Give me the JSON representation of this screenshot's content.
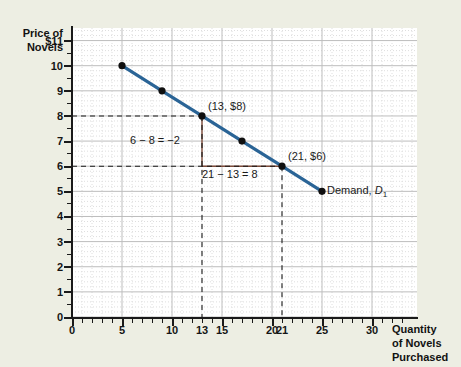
{
  "figure": {
    "background_color": "#edeee3",
    "plot_background_color": "#ffffff"
  },
  "axes": {
    "y_title_line1": "Price of",
    "y_title_line2": "Novels",
    "x_title_line1": "Quantity",
    "x_title_line2": "of Novels",
    "x_title_line3": "Purchased",
    "y_ticks": [
      "0",
      "1",
      "2",
      "3",
      "4",
      "5",
      "6",
      "7",
      "8",
      "9",
      "10",
      "$11"
    ],
    "x_ticks": [
      "0",
      "5",
      "10",
      "13",
      "15",
      "20",
      "21",
      "25",
      "30"
    ]
  },
  "annotations": {
    "point_a": "(13, $8)",
    "point_b": "(21, $6)",
    "rise": "6 − 8 = −2",
    "run": "21 − 13 = 8",
    "curve_label": "Demand, ",
    "curve_symbol": "D",
    "curve_subscript": "1"
  },
  "colors": {
    "curve": "#2a6496",
    "marker": "#101010",
    "slope_bracket": "#7c4b3a",
    "dashed_guide": "#1a1a1a",
    "grid_major": "#b9b9b9",
    "grid_minor": "#d8d8d8"
  },
  "chart_data": {
    "type": "line",
    "title": "",
    "xlabel": "Quantity of Novels Purchased",
    "ylabel": "Price of Novels",
    "xlim": [
      0,
      34.5
    ],
    "ylim": [
      0,
      11.5
    ],
    "grid": true,
    "legend_position": "inline-right",
    "series": [
      {
        "name": "Demand, D1",
        "color": "#2a6496",
        "x": [
          5,
          9,
          13,
          17,
          21,
          25
        ],
        "y": [
          10,
          9,
          8,
          7,
          6,
          5
        ],
        "markers": true,
        "slope": -0.25
      }
    ],
    "highlighted_points": [
      {
        "label": "(13, $8)",
        "x": 13,
        "y": 8
      },
      {
        "label": "(21, $6)",
        "x": 21,
        "y": 6
      }
    ],
    "slope_triangle": {
      "rise_label": "6 − 8 = −2",
      "run_label": "21 − 13 = 8",
      "from": [
        13,
        8
      ],
      "to": [
        21,
        6
      ]
    },
    "y_tick_values": [
      0,
      1,
      2,
      3,
      4,
      5,
      6,
      7,
      8,
      9,
      10,
      11
    ],
    "x_tick_values": [
      0,
      5,
      10,
      13,
      15,
      20,
      21,
      25,
      30
    ]
  }
}
